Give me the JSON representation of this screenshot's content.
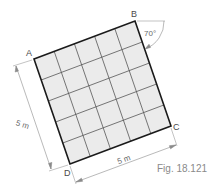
{
  "figure": {
    "caption": "Fig. 18.121",
    "grid": {
      "rows": 5,
      "cols": 5,
      "fill": "#ebebeb",
      "line": "#444444",
      "border": "#1a1a1a"
    },
    "corners": {
      "A": {
        "label": "A",
        "x": 34,
        "y": 59
      },
      "B": {
        "label": "B",
        "x": 135,
        "y": 21
      },
      "C": {
        "label": "C",
        "x": 171,
        "y": 126
      },
      "D": {
        "label": "D",
        "x": 70,
        "y": 164
      }
    },
    "angle": {
      "label": "70°"
    },
    "dimensions": {
      "left": {
        "label": "5 m"
      },
      "bottom": {
        "label": "5 m"
      }
    }
  }
}
